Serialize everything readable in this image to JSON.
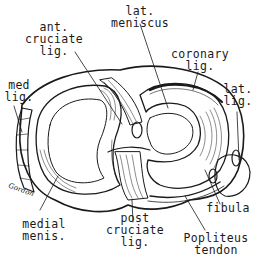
{
  "figure": {
    "colors": {
      "ink": "#1a1a1a",
      "background": "#ffffff"
    },
    "signature": "Gordon",
    "labels": {
      "ant_cruciate": {
        "line1": "ant.",
        "line2": "cruciate",
        "line3": "lig."
      },
      "lat_meniscus": {
        "line1": "lat.",
        "line2": "meniscus"
      },
      "coronary": {
        "line1": "coronary",
        "line2": "lig."
      },
      "med_lig": {
        "line1": "med",
        "line2": "lig."
      },
      "lat_lig": {
        "line1": "lat.",
        "line2": "lig."
      },
      "medial_menis": {
        "line1": "medial",
        "line2": "menis."
      },
      "post_cruciate": {
        "line1": "post",
        "line2": "cruciate",
        "line3": "lig."
      },
      "fibula": {
        "line1": "fibula"
      },
      "popliteus": {
        "line1": "Popliteus",
        "line2": "tendon"
      }
    }
  }
}
